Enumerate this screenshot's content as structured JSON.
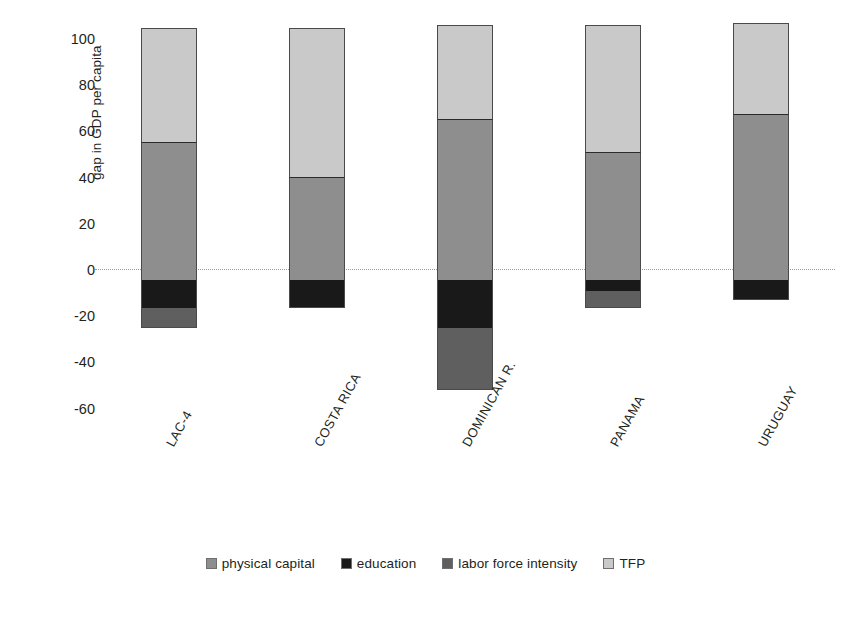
{
  "chart_data": {
    "type": "bar",
    "stacked": true,
    "orientation": "vertical",
    "title": "",
    "xlabel": "",
    "ylabel": "gap in GDP per capita",
    "ylim": [
      -60,
      100
    ],
    "yticks": [
      100,
      80,
      60,
      40,
      20,
      0,
      -20,
      -40,
      -60
    ],
    "ytick_labels": [
      "100",
      "80",
      "60",
      "40",
      "20",
      "0",
      "-20",
      "-40",
      "-60"
    ],
    "grid": false,
    "zero_line": true,
    "legend_position": "bottom",
    "categories": [
      "LAC-4",
      "COSTA RICA",
      "DOMINICAN R.",
      "PANAMA",
      "URUGUAY"
    ],
    "series": [
      {
        "name": "physical capital",
        "color": "#8e8e8e",
        "values": [
          55,
          41,
          64,
          51,
          66
        ]
      },
      {
        "name": "education",
        "color": "#191919",
        "values": [
          -11,
          -11,
          -19,
          -4.5,
          -8
        ]
      },
      {
        "name": "labor force intensity",
        "color": "#5f5f5f",
        "values": [
          -8,
          0,
          -25,
          -6.5,
          0
        ]
      },
      {
        "name": "TFP",
        "color": "#c9c9c9",
        "values": [
          46,
          60,
          38,
          51,
          37
        ]
      }
    ],
    "positive_totals": [
      101,
      101,
      102,
      102,
      103
    ],
    "negative_totals": [
      -19,
      -11,
      -44,
      -11,
      -8
    ]
  },
  "legend": {
    "items": [
      {
        "label": "physical capital",
        "color": "#8e8e8e"
      },
      {
        "label": "education",
        "color": "#191919"
      },
      {
        "label": "labor force intensity",
        "color": "#5f5f5f"
      },
      {
        "label": "TFP",
        "color": "#c9c9c9"
      }
    ]
  },
  "axis": {
    "y_title": "gap in GDP per capita"
  }
}
